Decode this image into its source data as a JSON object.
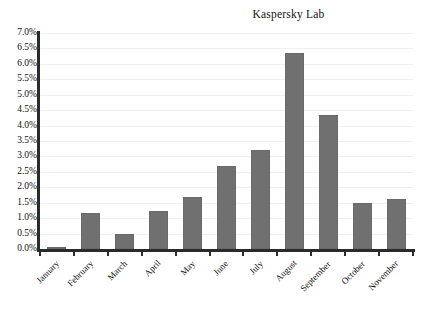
{
  "chart_data": {
    "type": "bar",
    "title": "Kaspersky Lab",
    "xlabel": "",
    "ylabel": "",
    "categories": [
      "January",
      "February",
      "March",
      "April",
      "May",
      "June",
      "July",
      "August",
      "September",
      "October",
      "November"
    ],
    "values": [
      0.05,
      1.18,
      0.5,
      1.23,
      1.7,
      2.7,
      3.2,
      6.35,
      4.35,
      1.5,
      1.62
    ],
    "value_unit": "%",
    "ylim": [
      0.0,
      7.0
    ],
    "ytick_step": 0.5,
    "ytick_labels": [
      "7.0%",
      "6.5%",
      "6.0%",
      "5.5%",
      "5.0%",
      "4.5%",
      "4.0%",
      "3.5%",
      "3.0%",
      "2.5%",
      "2.0%",
      "1.5%",
      "1.0%",
      "0.5%",
      "0.0%"
    ],
    "ytick_values": [
      7.0,
      6.5,
      6.0,
      5.5,
      5.0,
      4.5,
      4.0,
      3.5,
      3.0,
      2.5,
      2.0,
      1.5,
      1.0,
      0.5,
      0.0
    ],
    "grid": true,
    "legend": false,
    "legend_position": "none",
    "series": [
      {
        "name": "Kaspersky Lab",
        "color": "#707070",
        "values": [
          0.05,
          1.18,
          0.5,
          1.23,
          1.7,
          2.7,
          3.2,
          6.35,
          4.35,
          1.5,
          1.62
        ]
      }
    ]
  },
  "colors": {
    "bar_fill": "#707070",
    "bar_stroke": "#6a6a6a",
    "axis": "#2b2b2b",
    "gridline": "#f0f0f0",
    "text": "#111111",
    "background": "#ffffff"
  }
}
